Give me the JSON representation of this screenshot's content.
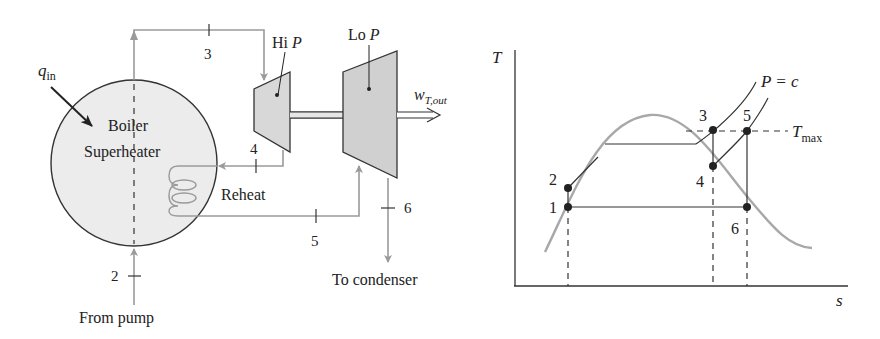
{
  "schematic": {
    "heat_input_label": "q",
    "heat_input_sub": "in",
    "boiler_label_line1": "Boiler",
    "boiler_label_line2": "Superheater",
    "hi_p_label": "Hi",
    "hi_p_var": "P",
    "lo_p_label": "Lo",
    "lo_p_var": "P",
    "work_label": "w",
    "work_sub": "T,out",
    "reheat_label": "Reheat",
    "to_condenser_label": "To condenser",
    "from_pump_label": "From pump",
    "state_labels": {
      "s2": "2",
      "s3": "3",
      "s4": "4",
      "s5": "5",
      "s6": "6"
    }
  },
  "ts_diagram": {
    "y_axis_label": "T",
    "x_axis_label": "s",
    "pressure_label": "P = c",
    "tmax_label": "T",
    "tmax_sub": "max",
    "points": {
      "p1": "1",
      "p2": "2",
      "p3": "3",
      "p4": "4",
      "p5": "5",
      "p6": "6"
    }
  },
  "colors": {
    "line": "#222222",
    "flow": "#9a9a9a",
    "fill": "#e8e8e8",
    "dome": "#a8a8a8"
  }
}
